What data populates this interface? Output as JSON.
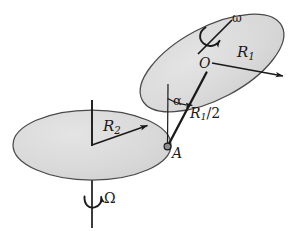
{
  "figure": {
    "type": "mechanics-diagram",
    "background_color": "#ffffff",
    "stroke_color": "#1a1a1a",
    "disk_fill_color": "#d8d8d8",
    "disk_edge_color": "#555555"
  },
  "labels": {
    "radius_lower": "R",
    "radius_lower_sub": "2",
    "radius_upper": "R",
    "radius_upper_sub": "1",
    "rod_length": "R",
    "rod_length_sub": "1",
    "rod_length_denom": "/2",
    "center_upper": "O",
    "contact_point": "A",
    "tilt_angle": "α",
    "spin_rate": "ω",
    "precession_rate": "Ω"
  },
  "elements": {
    "lower_disk": {
      "name": "turntable",
      "center": [
        92,
        145
      ],
      "rx": 79,
      "ry": 35,
      "rotation_deg": 0,
      "axis_top": [
        92,
        100
      ],
      "axis_bottom": [
        92,
        228
      ],
      "radius_arrow_to": [
        149,
        125
      ]
    },
    "upper_disk": {
      "name": "rolling-disk",
      "center": [
        212,
        63
      ],
      "rx": 79,
      "ry": 36,
      "rotation_deg": -28,
      "spin_axis_from": [
        198,
        54
      ],
      "spin_axis_to": [
        231,
        21
      ],
      "radius_arrow_to": [
        285,
        77
      ]
    },
    "rod": {
      "name": "connecting-rod",
      "from": [
        167,
        147
      ],
      "to": [
        206,
        73
      ]
    },
    "vertical_reference": {
      "from": [
        168,
        85
      ],
      "to": [
        167,
        147
      ]
    },
    "angle_arc": {
      "vertex": [
        167,
        147
      ],
      "radius": 48
    }
  }
}
